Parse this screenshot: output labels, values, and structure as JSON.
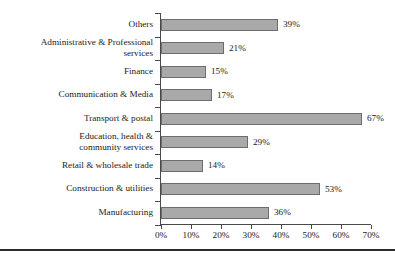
{
  "chart_data": {
    "type": "bar",
    "orientation": "horizontal",
    "title": "",
    "xlabel": "",
    "ylabel": "",
    "xlim": [
      0,
      70
    ],
    "xticks": [
      "0%",
      "10%",
      "20%",
      "30%",
      "40%",
      "50%",
      "60%",
      "70%"
    ],
    "xtick_values": [
      0,
      10,
      20,
      30,
      40,
      50,
      60,
      70
    ],
    "grid": false,
    "legend": false,
    "value_suffix": "%",
    "bar_color": "#a9a9a9",
    "bar_edge_color": "#6d6d6d",
    "axis_color": "#4a4a4a",
    "categories": [
      "Others",
      "Administrative & Professional\nservices",
      "Finance",
      "Communication & Media",
      "Transport & postal",
      "Education, health &\ncommunity services",
      "Retail & wholesale trade",
      "Construction & utilities",
      "Manufacturing"
    ],
    "values": [
      39,
      21,
      15,
      17,
      67,
      29,
      14,
      53,
      36
    ],
    "value_labels": [
      "39%",
      "21%",
      "15%",
      "17%",
      "67%",
      "29%",
      "14%",
      "53%",
      "36%"
    ]
  }
}
